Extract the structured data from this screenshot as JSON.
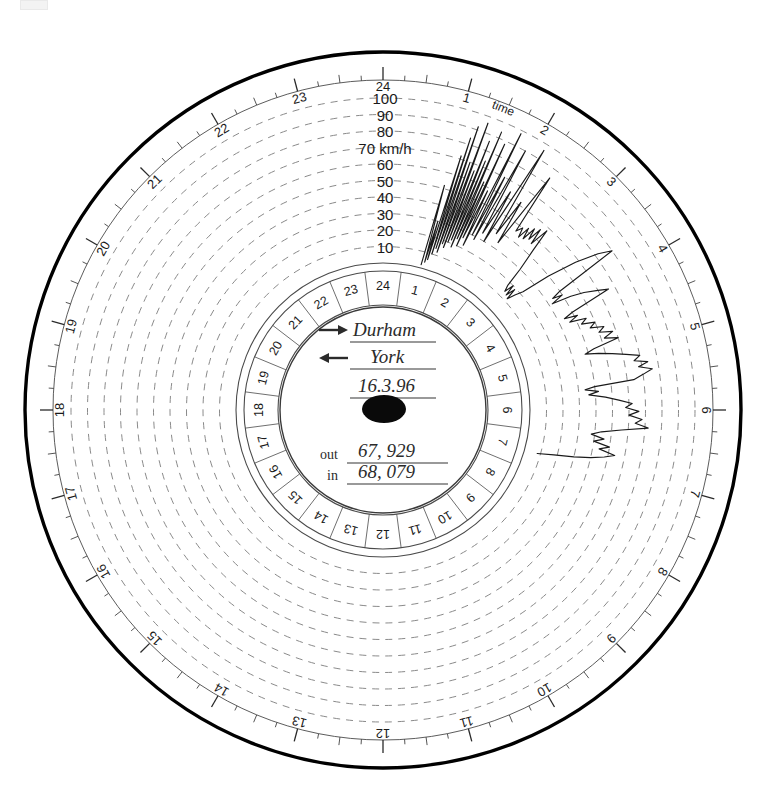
{
  "chart_data": {
    "type": "line",
    "subtitle": "Analogue tachograph recording disc",
    "xlabel": "time",
    "ylabel": "km/h",
    "grid": true,
    "legend_position": "none",
    "speed_scale": {
      "unit_label": "70 km/h",
      "unit": "km/h",
      "ticks": [
        10,
        20,
        30,
        40,
        50,
        60,
        70,
        80,
        90,
        100
      ],
      "tick_labels": [
        "10",
        "20",
        "30",
        "40",
        "50",
        "60",
        "70",
        "80",
        "90",
        "100"
      ],
      "ylim": [
        0,
        100
      ]
    },
    "time_axis": {
      "label": "time",
      "hours": [
        "1",
        "2",
        "3",
        "4",
        "5",
        "6",
        "7",
        "8",
        "9",
        "10",
        "11",
        "12",
        "13",
        "14",
        "15",
        "16",
        "17",
        "18",
        "19",
        "20",
        "21",
        "22",
        "23",
        "24"
      ],
      "xlim": [
        0,
        24
      ],
      "minor_tick_minutes": 15
    },
    "inner_hour_ring": {
      "hours": [
        "1",
        "2",
        "3",
        "4",
        "5",
        "6",
        "7",
        "8",
        "9",
        "10",
        "11",
        "12",
        "13",
        "14",
        "15",
        "16",
        "17",
        "18",
        "19",
        "20",
        "21",
        "22",
        "23",
        "24"
      ]
    },
    "trace_description": "Jagged speed trace recorded between roughly 01:00 and 07:00, oscillating between about 0 and 100 km/h.",
    "trace_start_hour": 0.95,
    "trace_end_hour": 7.1,
    "trace_points": [
      [
        0.98,
        2
      ],
      [
        1.02,
        52
      ],
      [
        1.05,
        4
      ],
      [
        1.08,
        30
      ],
      [
        1.1,
        6
      ],
      [
        1.14,
        72
      ],
      [
        1.16,
        10
      ],
      [
        1.19,
        84
      ],
      [
        1.21,
        14
      ],
      [
        1.24,
        92
      ],
      [
        1.26,
        12
      ],
      [
        1.29,
        70
      ],
      [
        1.31,
        18
      ],
      [
        1.34,
        96
      ],
      [
        1.36,
        16
      ],
      [
        1.39,
        66
      ],
      [
        1.41,
        20
      ],
      [
        1.44,
        86
      ],
      [
        1.46,
        22
      ],
      [
        1.49,
        74
      ],
      [
        1.51,
        18
      ],
      [
        1.54,
        94
      ],
      [
        1.56,
        24
      ],
      [
        1.59,
        62
      ],
      [
        1.61,
        20
      ],
      [
        1.64,
        88
      ],
      [
        1.66,
        26
      ],
      [
        1.7,
        58
      ],
      [
        1.73,
        22
      ],
      [
        1.77,
        98
      ],
      [
        1.8,
        30
      ],
      [
        1.84,
        70
      ],
      [
        1.87,
        28
      ],
      [
        1.92,
        90
      ],
      [
        1.96,
        34
      ],
      [
        2.02,
        64
      ],
      [
        2.06,
        30
      ],
      [
        2.12,
        96
      ],
      [
        2.18,
        38
      ],
      [
        2.24,
        62
      ],
      [
        2.3,
        34
      ],
      [
        2.38,
        84
      ],
      [
        2.44,
        46
      ],
      [
        2.5,
        50
      ],
      [
        2.54,
        44
      ],
      [
        2.58,
        52
      ],
      [
        2.62,
        45
      ],
      [
        2.66,
        54
      ],
      [
        2.7,
        47
      ],
      [
        2.74,
        56
      ],
      [
        2.78,
        46
      ],
      [
        2.83,
        58
      ],
      [
        2.88,
        44
      ],
      [
        2.95,
        30
      ],
      [
        3.0,
        18
      ],
      [
        3.05,
        14
      ],
      [
        3.09,
        20
      ],
      [
        3.13,
        13
      ],
      [
        3.17,
        19
      ],
      [
        3.21,
        12
      ],
      [
        3.26,
        17
      ],
      [
        3.32,
        22
      ],
      [
        3.4,
        40
      ],
      [
        3.5,
        58
      ],
      [
        3.6,
        72
      ],
      [
        3.68,
        80
      ],
      [
        3.74,
        40
      ],
      [
        3.78,
        34
      ],
      [
        3.82,
        40
      ],
      [
        3.86,
        32
      ],
      [
        3.92,
        44
      ],
      [
        3.98,
        52
      ],
      [
        4.06,
        60
      ],
      [
        4.12,
        66
      ],
      [
        4.18,
        40
      ],
      [
        4.22,
        34
      ],
      [
        4.27,
        42
      ],
      [
        4.32,
        36
      ],
      [
        4.38,
        46
      ],
      [
        4.44,
        42
      ],
      [
        4.5,
        50
      ],
      [
        4.56,
        46
      ],
      [
        4.62,
        54
      ],
      [
        4.68,
        50
      ],
      [
        4.74,
        58
      ],
      [
        4.8,
        52
      ],
      [
        4.86,
        60
      ],
      [
        4.92,
        44
      ],
      [
        4.97,
        38
      ],
      [
        5.02,
        46
      ],
      [
        5.08,
        54
      ],
      [
        5.14,
        62
      ],
      [
        5.2,
        70
      ],
      [
        5.26,
        66
      ],
      [
        5.31,
        74
      ],
      [
        5.36,
        68
      ],
      [
        5.42,
        76
      ],
      [
        5.48,
        70
      ],
      [
        5.54,
        64
      ],
      [
        5.58,
        40
      ],
      [
        5.62,
        34
      ],
      [
        5.67,
        42
      ],
      [
        5.72,
        36
      ],
      [
        5.78,
        46
      ],
      [
        5.84,
        54
      ],
      [
        5.9,
        62
      ],
      [
        5.96,
        58
      ],
      [
        6.02,
        66
      ],
      [
        6.08,
        60
      ],
      [
        6.14,
        68
      ],
      [
        6.2,
        64
      ],
      [
        6.26,
        72
      ],
      [
        6.32,
        56
      ],
      [
        6.38,
        44
      ],
      [
        6.44,
        38
      ],
      [
        6.5,
        46
      ],
      [
        6.56,
        40
      ],
      [
        6.62,
        50
      ],
      [
        6.68,
        44
      ],
      [
        6.74,
        54
      ],
      [
        6.8,
        48
      ],
      [
        6.86,
        40
      ],
      [
        6.92,
        30
      ],
      [
        6.98,
        18
      ],
      [
        7.05,
        8
      ]
    ]
  },
  "center": {
    "destination_label": "Durham",
    "origin_label": "York",
    "date": "16.3.96",
    "odometer_out_label": "out",
    "odometer_out_value": "67, 929",
    "odometer_in_label": "in",
    "odometer_in_value": "68, 079",
    "arrow_out": "arrow-right",
    "arrow_in": "arrow-left",
    "spindle": "center-spindle"
  },
  "colors": {
    "ink": "#1a1a1a",
    "grid": "#8a8a8a",
    "rim": "#000000",
    "paper": "#ffffff",
    "handwriting": "#2b2b2b"
  }
}
